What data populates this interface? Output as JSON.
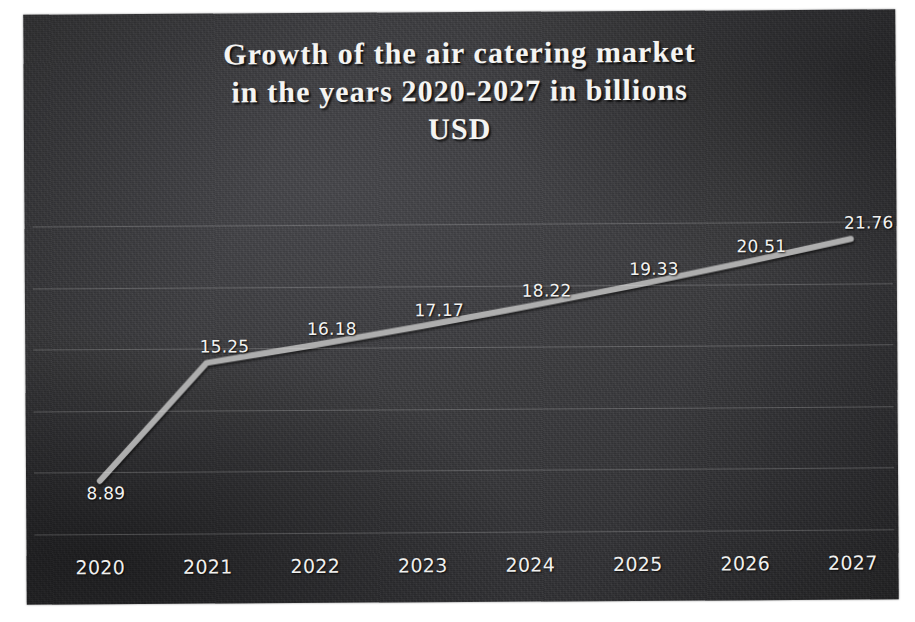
{
  "chart_data": {
    "type": "line",
    "title": "Growth of the air catering market in the years 2020-2027 in billions USD",
    "title_lines": [
      "Growth of the air catering market",
      "in the years 2020-2027 in billions",
      "USD"
    ],
    "xlabel": "",
    "ylabel": "",
    "categories": [
      "2020",
      "2021",
      "2022",
      "2023",
      "2024",
      "2025",
      "2026",
      "2027"
    ],
    "values": [
      8.89,
      15.25,
      16.18,
      17.17,
      18.22,
      19.33,
      20.51,
      21.76
    ],
    "point_labels": [
      "8.89",
      "15.25",
      "16.18",
      "17.17",
      "18.22",
      "19.33",
      "20.51",
      "21.76"
    ],
    "series": [
      {
        "name": "Air catering market size (billion USD)",
        "values": [
          8.89,
          15.25,
          16.18,
          17.17,
          18.22,
          19.33,
          20.51,
          21.76
        ]
      }
    ],
    "ylim": [
      6.0,
      24.0
    ],
    "grid": true,
    "gridlines_count": 6,
    "legend": false,
    "legend_position": "none",
    "data_labels_shown": true,
    "units": "billions USD"
  },
  "style": {
    "background_color": "#3a3a3d",
    "line_color": "#aeaeae",
    "text_color": "#f2f2f0",
    "gridline_color": "#ebebeb",
    "page_color": "#ffffff"
  }
}
